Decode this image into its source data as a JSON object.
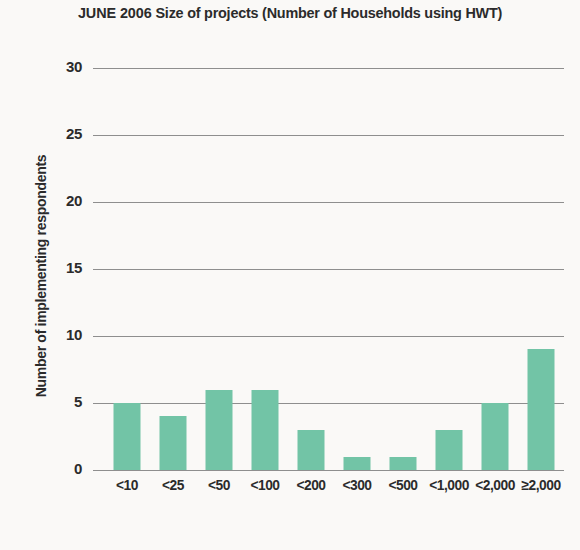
{
  "chart_data": {
    "type": "bar",
    "title_strong": "JUNE 2006",
    "title_rest": "Size of projects (Number of Households using HWT)",
    "xlabel": "",
    "ylabel": "Number of implementing respondents",
    "categories": [
      "<10",
      "<25",
      "<50",
      "<100",
      "<200",
      "<300",
      "<500",
      "<1,000",
      "<2,000",
      "≥2,000"
    ],
    "values": [
      5,
      4,
      6,
      6,
      3,
      1,
      1,
      3,
      5,
      9
    ],
    "ylim": [
      0,
      30
    ],
    "yticks": [
      0,
      5,
      10,
      15,
      20,
      25,
      30
    ],
    "ytick_labels": [
      "0",
      "5",
      "10",
      "15",
      "20",
      "25",
      "30"
    ],
    "grid": "horizontal",
    "legend": "none",
    "bar_color": "#72c4a6",
    "background_color": "#faf9f7",
    "axis_color": "#8e8e8e",
    "text_color": "#2b2b2b"
  }
}
